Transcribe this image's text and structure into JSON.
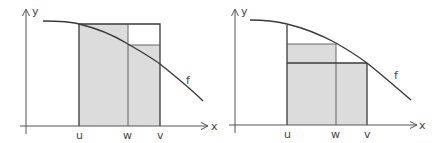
{
  "colors": {
    "line": "#3a3a3a",
    "axis": "#555555",
    "fill": "#dcdcdc",
    "background": "#ffffff"
  },
  "panels": [
    {
      "id": "left",
      "description": "Upper bound rectangles: total upper rectangle over [u,v] with height f(u), split at w",
      "axis_labels": {
        "x": "x",
        "y": "y"
      },
      "curve_label": "f",
      "tick_labels": {
        "u": "u",
        "w": "w",
        "v": "v"
      }
    },
    {
      "id": "right",
      "description": "Lower bound rectangles: rectangle over [u,v] with height f(v) plus rectangle over [u,w] with height f(w)",
      "axis_labels": {
        "x": "x",
        "y": "y"
      },
      "curve_label": "f",
      "tick_labels": {
        "u": "u",
        "w": "w",
        "v": "v"
      }
    }
  ]
}
